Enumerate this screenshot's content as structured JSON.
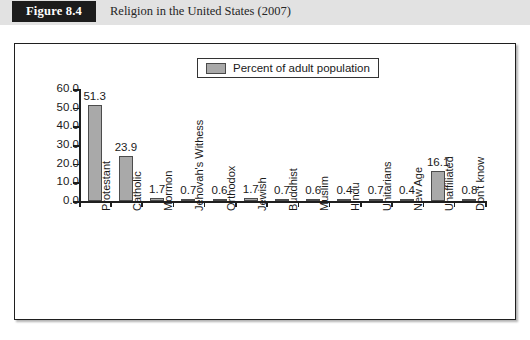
{
  "figure": {
    "badge": "Figure 8.4",
    "caption": "Religion in the United States (2007)"
  },
  "legend": {
    "label": "Percent of adult population",
    "swatch_color": "#a9a9a9"
  },
  "chart_data": {
    "type": "bar",
    "title": "Religion in the United States (2007)",
    "xlabel": "",
    "ylabel": "",
    "ylim": [
      0,
      60
    ],
    "ytick_labels": [
      "0.0",
      "10.0",
      "20.0",
      "30.0",
      "40.0",
      "50.0",
      "60.0"
    ],
    "ytick_values": [
      0,
      10,
      20,
      30,
      40,
      50,
      60
    ],
    "grid": false,
    "legend_position": "top-center",
    "series_name": "Percent of adult population",
    "bar_color": "#a9a9a9",
    "bar_border_color": "#4c4c4c",
    "categories": [
      "Protestant",
      "Catholic",
      "Mormon",
      "Jehovah's Withess",
      "Orthodox",
      "Jewish",
      "Buddhist",
      "Muslim",
      "Hindu",
      "Unitarians",
      "New Age",
      "Unaffiliated",
      "Don't know"
    ],
    "values": [
      51.3,
      23.9,
      1.7,
      0.7,
      0.6,
      1.7,
      0.7,
      0.6,
      0.4,
      0.7,
      0.4,
      16.1,
      0.8
    ],
    "value_labels": [
      "51.3",
      "23.9",
      "1.7",
      "0.7",
      "0.6",
      "1.7",
      "0.7",
      "0.6",
      "0.4",
      "0.7",
      "0.4",
      "16.1",
      "0.8"
    ]
  }
}
